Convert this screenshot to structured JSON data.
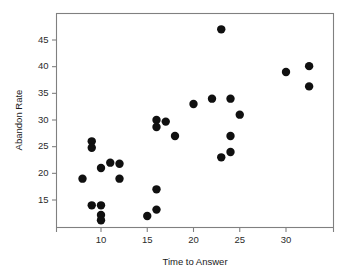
{
  "chart_data": {
    "type": "scatter",
    "title": "",
    "xlabel": "Time to Answer",
    "ylabel": "Abandon Rate",
    "xlim": [
      6.5,
      34.5
    ],
    "ylim": [
      10.2,
      48.5
    ],
    "xticks": [
      10,
      15,
      20,
      25,
      30
    ],
    "yticks": [
      15,
      20,
      25,
      30,
      35,
      40,
      45
    ],
    "xtick_labels": [
      "10",
      "15",
      "20",
      "25",
      "30"
    ],
    "ytick_labels": [
      "15",
      "20",
      "25",
      "30",
      "35",
      "40",
      "45"
    ],
    "grid": false,
    "legend": false,
    "marker": "filled-circle",
    "marker_color": "#101010",
    "marker_size": 4.2,
    "frame_color": "#808080",
    "background": "#ffffff",
    "series": [
      {
        "name": "observations",
        "points": [
          [
            8.0,
            19.0
          ],
          [
            9.0,
            26.0
          ],
          [
            9.0,
            24.8
          ],
          [
            9.0,
            14.0
          ],
          [
            10.0,
            21.0
          ],
          [
            10.0,
            14.0
          ],
          [
            10.0,
            12.2
          ],
          [
            10.0,
            11.2
          ],
          [
            11.0,
            22.0
          ],
          [
            12.0,
            21.8
          ],
          [
            12.0,
            19.0
          ],
          [
            15.0,
            12.0
          ],
          [
            16.0,
            30.0
          ],
          [
            16.0,
            28.7
          ],
          [
            16.0,
            17.0
          ],
          [
            16.0,
            13.2
          ],
          [
            17.0,
            29.7
          ],
          [
            18.0,
            27.0
          ],
          [
            20.0,
            33.0
          ],
          [
            22.0,
            34.0
          ],
          [
            23.0,
            47.0
          ],
          [
            23.0,
            23.0
          ],
          [
            24.0,
            34.0
          ],
          [
            24.0,
            27.0
          ],
          [
            24.0,
            24.0
          ],
          [
            25.0,
            31.0
          ],
          [
            30.0,
            39.0
          ],
          [
            32.5,
            40.1
          ],
          [
            32.5,
            36.3
          ]
        ]
      }
    ]
  },
  "axes": {
    "x_title": "Time to Answer",
    "y_title": "Abandon Rate"
  }
}
